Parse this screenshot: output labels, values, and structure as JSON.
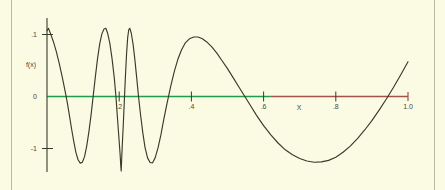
{
  "chart_data": {
    "type": "line",
    "title": "",
    "xlabel": "X",
    "ylabel": "f(x)",
    "xlim": [
      0,
      1.0
    ],
    "ylim": [
      -1.15,
      1.15
    ],
    "grid": false,
    "legend": null,
    "x_ticks": [
      {
        "value": 0.2,
        "label": ".2"
      },
      {
        "value": 0.4,
        "label": ".4"
      },
      {
        "value": 0.6,
        "label": ".6"
      },
      {
        "value": 0.8,
        "label": ".8"
      },
      {
        "value": 1.0,
        "label": "1.0"
      }
    ],
    "y_ticks": [
      {
        "value": 1.0,
        "label": ".1"
      },
      {
        "value": 0.0,
        "label": "0"
      },
      {
        "value": -1.0,
        "label": "-1"
      }
    ],
    "axis_colors": {
      "x_axis_left_segment": "#1f9b4e",
      "x_axis_right_segment": "#a0534a",
      "y_axis": "#3a3a2c",
      "curve": "#3a3a2c",
      "frame": "#b9bba0",
      "background": "#fbfbe4"
    },
    "x_axis_color_split_value": 0.62,
    "series": [
      {
        "name": "f(x)",
        "color": "#3a3a2c",
        "points": [
          [
            0.0,
            1.06
          ],
          [
            0.004,
            1.1
          ],
          [
            0.01,
            1.01
          ],
          [
            0.018,
            0.88
          ],
          [
            0.026,
            0.72
          ],
          [
            0.034,
            0.53
          ],
          [
            0.042,
            0.32
          ],
          [
            0.05,
            0.09
          ],
          [
            0.056,
            -0.09
          ],
          [
            0.062,
            -0.3
          ],
          [
            0.068,
            -0.52
          ],
          [
            0.074,
            -0.72
          ],
          [
            0.08,
            -0.9
          ],
          [
            0.086,
            -1.02
          ],
          [
            0.092,
            -1.075
          ],
          [
            0.098,
            -1.06
          ],
          [
            0.104,
            -0.97
          ],
          [
            0.11,
            -0.8
          ],
          [
            0.116,
            -0.57
          ],
          [
            0.122,
            -0.3
          ],
          [
            0.128,
            0.01
          ],
          [
            0.134,
            0.32
          ],
          [
            0.14,
            0.61
          ],
          [
            0.146,
            0.85
          ],
          [
            0.152,
            1.01
          ],
          [
            0.158,
            1.09
          ],
          [
            0.163,
            1.1
          ],
          [
            0.168,
            1.02
          ],
          [
            0.174,
            0.86
          ],
          [
            0.18,
            0.62
          ],
          [
            0.186,
            0.32
          ],
          [
            0.191,
            0.0
          ],
          [
            0.195,
            -0.33
          ],
          [
            0.199,
            -0.65
          ],
          [
            0.2025,
            -0.93
          ],
          [
            0.2045,
            -1.13
          ],
          [
            0.2055,
            -1.2
          ],
          [
            0.2065,
            -1.06
          ],
          [
            0.2085,
            -0.79
          ],
          [
            0.2115,
            -0.43
          ],
          [
            0.2145,
            -0.03
          ],
          [
            0.2175,
            0.36
          ],
          [
            0.2205,
            0.7
          ],
          [
            0.2235,
            0.95
          ],
          [
            0.2265,
            1.08
          ],
          [
            0.2295,
            1.1
          ],
          [
            0.2335,
            1.02
          ],
          [
            0.2385,
            0.84
          ],
          [
            0.2435,
            0.59
          ],
          [
            0.2485,
            0.3
          ],
          [
            0.2535,
            0.0
          ],
          [
            0.2595,
            -0.31
          ],
          [
            0.2655,
            -0.59
          ],
          [
            0.2715,
            -0.82
          ],
          [
            0.2785,
            -0.99
          ],
          [
            0.2855,
            -1.065
          ],
          [
            0.2925,
            -1.07
          ],
          [
            0.2995,
            -0.99
          ],
          [
            0.3075,
            -0.83
          ],
          [
            0.3155,
            -0.62
          ],
          [
            0.3235,
            -0.37
          ],
          [
            0.3325,
            -0.11
          ],
          [
            0.3425,
            0.16
          ],
          [
            0.3525,
            0.4
          ],
          [
            0.3625,
            0.6
          ],
          [
            0.3725,
            0.75
          ],
          [
            0.3825,
            0.86
          ],
          [
            0.3945,
            0.93
          ],
          [
            0.4065,
            0.96
          ],
          [
            0.4185,
            0.96
          ],
          [
            0.4305,
            0.93
          ],
          [
            0.4425,
            0.88
          ],
          [
            0.4565,
            0.8
          ],
          [
            0.4705,
            0.7
          ],
          [
            0.4845,
            0.58
          ],
          [
            0.5,
            0.45
          ],
          [
            0.516,
            0.3
          ],
          [
            0.532,
            0.15
          ],
          [
            0.548,
            0.0
          ],
          [
            0.564,
            -0.15
          ],
          [
            0.58,
            -0.3
          ],
          [
            0.6,
            -0.47
          ],
          [
            0.62,
            -0.62
          ],
          [
            0.64,
            -0.75
          ],
          [
            0.66,
            -0.86
          ],
          [
            0.68,
            -0.94
          ],
          [
            0.7,
            -1.0
          ],
          [
            0.72,
            -1.04
          ],
          [
            0.74,
            -1.06
          ],
          [
            0.76,
            -1.055
          ],
          [
            0.78,
            -1.03
          ],
          [
            0.8,
            -0.98
          ],
          [
            0.82,
            -0.9
          ],
          [
            0.84,
            -0.8
          ],
          [
            0.86,
            -0.68
          ],
          [
            0.88,
            -0.54
          ],
          [
            0.9,
            -0.39
          ],
          [
            0.92,
            -0.22
          ],
          [
            0.94,
            -0.04
          ],
          [
            0.96,
            0.15
          ],
          [
            0.98,
            0.35
          ],
          [
            1.0,
            0.56
          ]
        ]
      }
    ]
  },
  "figure": {
    "x_axis_label": "X",
    "y_axis_label": "f(x)"
  }
}
